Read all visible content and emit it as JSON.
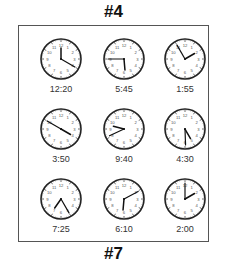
{
  "header": {
    "title": "#4"
  },
  "footer": {
    "title": "#7"
  },
  "clocks": [
    {
      "label": "12:20",
      "hour_angle": 0,
      "minute_angle": 120
    },
    {
      "label": "5:45",
      "hour_angle": 175,
      "minute_angle": 270
    },
    {
      "label": "1:55",
      "hour_angle": 60,
      "minute_angle": 330
    },
    {
      "label": "3:50",
      "hour_angle": 120,
      "minute_angle": 300
    },
    {
      "label": "9:40",
      "hour_angle": 285,
      "minute_angle": 245
    },
    {
      "label": "4:30",
      "hour_angle": 150,
      "minute_angle": 178
    },
    {
      "label": "7:25",
      "hour_angle": 215,
      "minute_angle": 150
    },
    {
      "label": "6:10",
      "hour_angle": 185,
      "minute_angle": 62
    },
    {
      "label": "2:00",
      "hour_angle": 60,
      "minute_angle": 0
    }
  ]
}
